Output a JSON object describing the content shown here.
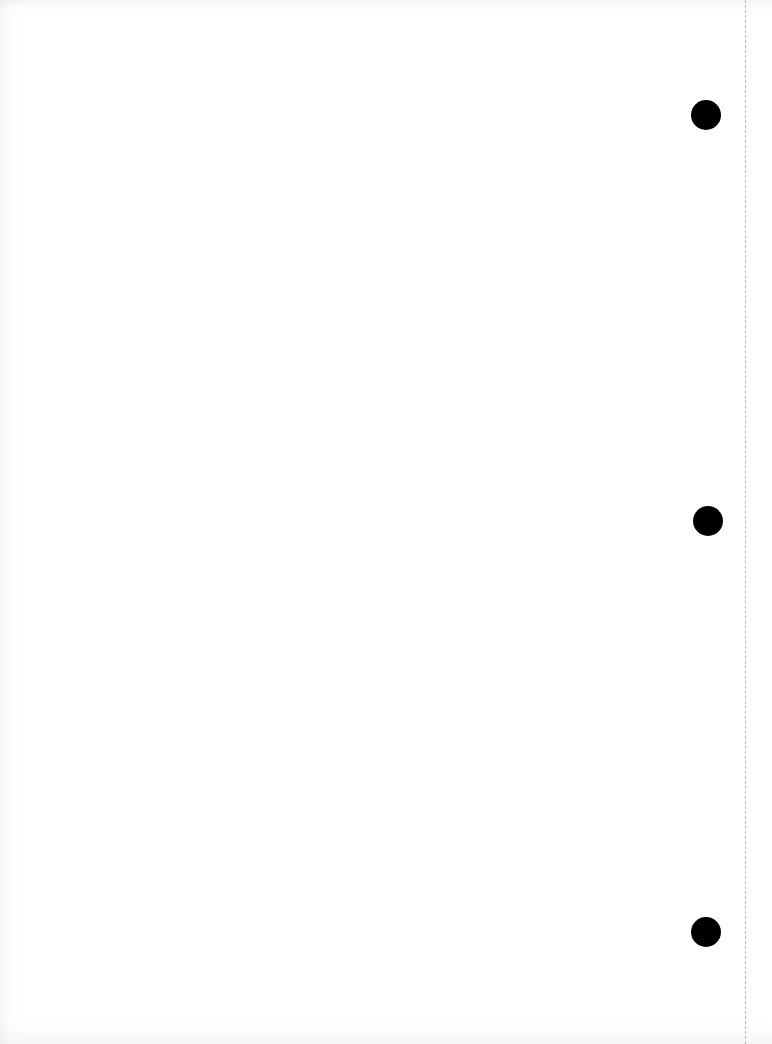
{
  "document": {
    "kind": "scanned-blank-page",
    "page_width": 772,
    "page_height": 1044,
    "background_color": "#ffffff",
    "visible_text": "",
    "text_content_present": false
  },
  "marks": {
    "registration_dots": {
      "name": "registration-dots",
      "description": "Three solid black filled circles aligned in a vertical column near the right margin",
      "count": 3,
      "color": "#000000",
      "shape": "circle",
      "items": [
        {
          "label": "dot-1",
          "cx": 706,
          "cy": 115,
          "diameter": 30
        },
        {
          "label": "dot-2",
          "cx": 708,
          "cy": 521,
          "diameter": 30
        },
        {
          "label": "dot-3",
          "cx": 706,
          "cy": 932,
          "diameter": 30
        }
      ]
    },
    "perforation_line": {
      "name": "perforation-line",
      "description": "Vertical dashed rule running the full height of the page near the right edge",
      "orientation": "vertical",
      "x": 745,
      "y_start": 0,
      "y_end": 1044,
      "color": "#b9b9b9",
      "stroke_width": 1,
      "dash_length": 10,
      "gap_length": 4
    }
  },
  "scan_artifacts": {
    "name": "scan-shadow-artifacts",
    "description": "Faint gray scanner shadow gradients bleeding along the top, bottom and left edges",
    "edges": [
      "top",
      "bottom",
      "left"
    ],
    "tint_color": "#8a8a8a"
  }
}
